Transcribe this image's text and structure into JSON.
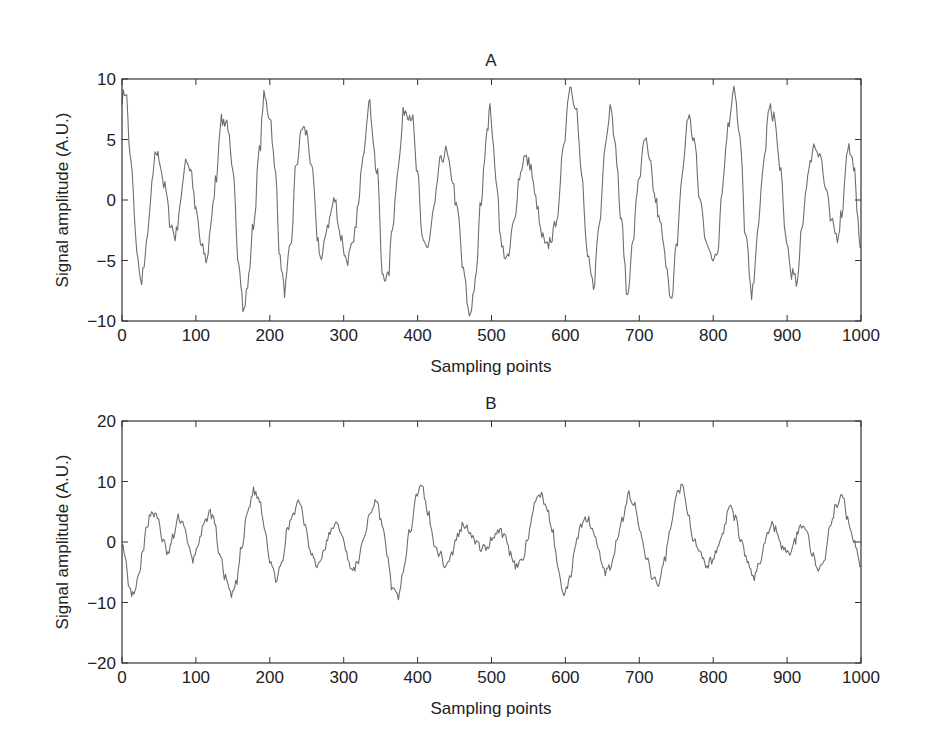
{
  "chart_data": [
    {
      "type": "line",
      "title": "A",
      "xlabel": "Sampling points",
      "ylabel": "Signal amplitude (A.U.)",
      "xlim": [
        0,
        1000
      ],
      "ylim": [
        -10,
        10
      ],
      "xticks": [
        "0",
        "100",
        "200",
        "300",
        "400",
        "500",
        "600",
        "700",
        "800",
        "900",
        "1000"
      ],
      "yticks": [
        "10",
        "5",
        "0",
        "-5",
        "-10"
      ],
      "grid": false,
      "line_color": "#6e6e6e",
      "series": [
        {
          "name": "A",
          "x": [
            0,
            5,
            12,
            20,
            25,
            30,
            36,
            42,
            46,
            50,
            58,
            66,
            72,
            80,
            86,
            93,
            100,
            108,
            115,
            120,
            128,
            133,
            142,
            150,
            158,
            165,
            170,
            178,
            186,
            192,
            200,
            208,
            214,
            220,
            228,
            236,
            244,
            250,
            258,
            264,
            270,
            278,
            288,
            296,
            304,
            312,
            320,
            326,
            334,
            346,
            352,
            360,
            366,
            374,
            382,
            392,
            400,
            406,
            414,
            422,
            430,
            438,
            446,
            454,
            462,
            470,
            478,
            486,
            494,
            498,
            506,
            514,
            522,
            530,
            538,
            544,
            552,
            560,
            568,
            574,
            582,
            590,
            598,
            606,
            614,
            622,
            630,
            638,
            646,
            654,
            662,
            668,
            676,
            684,
            690,
            700,
            708,
            714,
            722,
            728,
            736,
            744,
            750,
            758,
            766,
            774,
            782,
            790,
            798,
            806,
            812,
            820,
            828,
            836,
            844,
            852,
            860,
            868,
            876,
            882,
            890,
            898,
            906,
            914,
            920,
            928,
            936,
            944,
            952,
            960,
            968,
            974,
            982,
            990,
            996,
            1000
          ],
          "y": [
            8.5,
            9,
            3,
            -4,
            -6.8,
            -5.5,
            -2,
            2,
            4,
            3.5,
            1,
            -2,
            -3,
            0,
            3.5,
            2.5,
            -1,
            -4,
            -5,
            -2,
            2,
            6.5,
            6.5,
            2,
            -5,
            -9.3,
            -7,
            -2,
            4,
            8.5,
            7,
            2,
            -5,
            -7.5,
            -4,
            3,
            6,
            5.5,
            2,
            -3,
            -5,
            -2,
            0,
            -3,
            -5,
            -4,
            -0.5,
            4,
            8,
            2,
            -6,
            -6.5,
            -2,
            3,
            7.5,
            7,
            2,
            -3,
            -4,
            -1,
            3,
            4,
            2,
            -1,
            -6,
            -9.5,
            -7,
            0,
            6,
            7.5,
            2,
            -4,
            -5,
            -2,
            2,
            3.5,
            3,
            0,
            -3,
            -4,
            -3,
            -1,
            5,
            9.5,
            8,
            2,
            -5,
            -7,
            -2,
            5,
            8,
            4,
            -2,
            -8,
            -4,
            2,
            5,
            3,
            0,
            -2,
            -5,
            -8.5,
            -4,
            2,
            7,
            5,
            0,
            -3,
            -5,
            -4,
            1,
            6,
            9.5,
            5,
            -3,
            -8,
            -3,
            3,
            7.5,
            7,
            3,
            -3,
            -6,
            -7,
            -2,
            2,
            4.5,
            4,
            1,
            -2,
            -3,
            -1,
            4.5,
            3,
            -2,
            -4,
            -1,
            4,
            3.5,
            1,
            -3,
            -5,
            -4,
            2,
            6,
            4,
            -2,
            -8.5,
            -3,
            3,
            9,
            6,
            -2,
            -6,
            -3,
            4,
            7.5,
            5,
            0,
            -3,
            -5,
            -4,
            0
          ],
          "noise": 0.6
        }
      ]
    },
    {
      "type": "line",
      "title": "B",
      "xlabel": "Sampling points",
      "ylabel": "Signal amplitude (A.U.)",
      "xlim": [
        0,
        1000
      ],
      "ylim": [
        -20,
        20
      ],
      "xticks": [
        "0",
        "100",
        "200",
        "300",
        "400",
        "500",
        "600",
        "700",
        "800",
        "900",
        "1000"
      ],
      "yticks": [
        "20",
        "10",
        "0",
        "-10",
        "-20"
      ],
      "grid": false,
      "line_color": "#6e6e6e",
      "series": [
        {
          "name": "B",
          "x": [
            0,
            4,
            10,
            16,
            22,
            28,
            34,
            40,
            48,
            56,
            62,
            70,
            76,
            84,
            90,
            96,
            104,
            112,
            118,
            124,
            132,
            140,
            148,
            154,
            162,
            170,
            178,
            186,
            194,
            200,
            208,
            216,
            224,
            232,
            240,
            248,
            256,
            264,
            272,
            280,
            288,
            296,
            304,
            312,
            320,
            328,
            336,
            344,
            352,
            360,
            366,
            374,
            382,
            390,
            398,
            406,
            414,
            422,
            430,
            438,
            446,
            454,
            462,
            470,
            478,
            486,
            494,
            502,
            510,
            518,
            526,
            534,
            542,
            550,
            558,
            566,
            574,
            582,
            590,
            598,
            606,
            614,
            622,
            630,
            638,
            646,
            654,
            662,
            670,
            678,
            686,
            694,
            702,
            710,
            718,
            726,
            734,
            742,
            750,
            758,
            766,
            774,
            782,
            790,
            798,
            806,
            814,
            822,
            830,
            838,
            846,
            854,
            862,
            870,
            878,
            886,
            894,
            902,
            910,
            918,
            926,
            934,
            942,
            950,
            958,
            966,
            974,
            982,
            990,
            1000
          ],
          "y": [
            0,
            -3,
            -8,
            -9,
            -6,
            -2,
            3,
            5,
            4,
            0,
            -2,
            1,
            4,
            3,
            -1,
            -3,
            0,
            3,
            5,
            4,
            -2,
            -6,
            -9,
            -7,
            -1,
            5,
            8.5,
            7,
            2,
            -3,
            -6,
            -4,
            2,
            5,
            7,
            3,
            -2,
            -4,
            -2,
            1,
            3,
            2,
            -2,
            -5,
            -3,
            1,
            5,
            7,
            3,
            -3,
            -8,
            -9,
            -4,
            2,
            8,
            9,
            5,
            0,
            -2,
            -4,
            -2,
            1,
            3,
            2,
            0,
            -1,
            -1,
            1,
            2,
            1,
            -2,
            -4,
            -3,
            1,
            6,
            8,
            6,
            2,
            -4,
            -9,
            -6,
            0,
            3,
            4,
            2,
            -2,
            -5,
            -4,
            0,
            4,
            8,
            6,
            1,
            -3,
            -6,
            -7,
            -3,
            2,
            8,
            9,
            5,
            0,
            -2,
            -4,
            -3,
            -1,
            2,
            6,
            4,
            0,
            -3,
            -6,
            -4,
            0,
            3,
            2,
            -1,
            -2,
            0,
            3,
            2,
            -2,
            -5,
            -3,
            2,
            6,
            8,
            4,
            0,
            -4,
            -9,
            -6,
            -2,
            3,
            7,
            5,
            1,
            -3,
            -3,
            0,
            3,
            5,
            4,
            -1,
            -3,
            -5,
            -2,
            0,
            4,
            6,
            2,
            -3,
            -9,
            -6,
            0,
            5,
            11,
            8,
            2,
            -3,
            -9,
            -4,
            1,
            4,
            7,
            3,
            -3,
            -7,
            -4,
            3,
            5
          ],
          "noise": 0.7
        }
      ]
    }
  ]
}
